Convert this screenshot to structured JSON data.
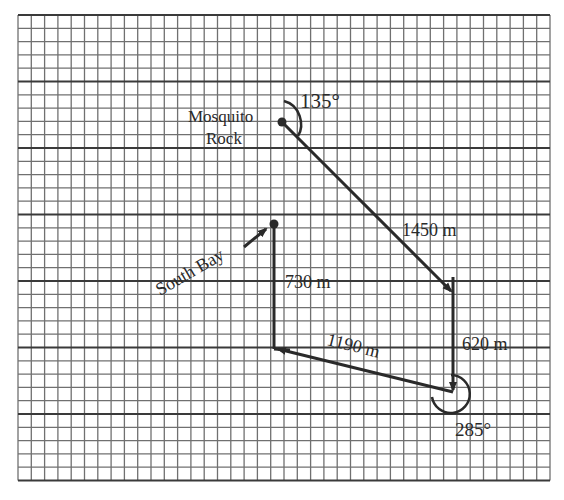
{
  "diagram": {
    "type": "vector-displacement-map",
    "grid": {
      "columns": 40,
      "rows": 35,
      "major_every": 5,
      "line_color": "#707070",
      "major_color": "#3a3a3a"
    },
    "labels": {
      "mosquito_rock_line1": "Mosquito",
      "mosquito_rock_line2": "Rock",
      "south_bay": "South Bay",
      "angle_start": "135°",
      "angle_end": "285°",
      "leg1": "1450 m",
      "leg2": "620 m",
      "leg3": "1190 m",
      "leg4": "730 m"
    },
    "points": {
      "mosquito_rock": [
        282,
        122
      ],
      "turn1": [
        453,
        292
      ],
      "turn2": [
        453,
        392
      ],
      "turn3": [
        274,
        349
      ],
      "south_bay": [
        274,
        224
      ]
    },
    "ink_color": "#2a2a2a"
  }
}
